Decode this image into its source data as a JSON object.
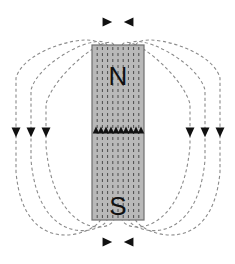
{
  "figure": {
    "canvas": {
      "width": 235,
      "height": 264,
      "background": "#ffffff"
    }
  },
  "magnet": {
    "name": "bar-magnet",
    "x": 92,
    "y": 45,
    "width": 52,
    "height": 175,
    "fill": "#b9b9b9",
    "stroke": "#6e6e6e",
    "stroke_width": 1.2,
    "north_label": "N",
    "south_label": "S",
    "north_label_x": 118,
    "north_label_y": 78,
    "south_label_x": 118,
    "south_label_y": 208,
    "label_font_size": 26,
    "label_color": "#111111"
  },
  "field": {
    "line_color": "#8a8a8a",
    "line_width": 1.1,
    "dash": "3.2 2.6",
    "arrow_color": "#111111",
    "interior_line_count": 9,
    "interior_line_color": "#4a4a4a",
    "exterior_loop_count_per_side": 3,
    "description": "Dashed magnetic field lines looping from N pole over the top, down the sides, and returning to the S pole; interior lines run upward from S to N."
  },
  "chart_data": {
    "type": "diagram",
    "elements": {
      "magnet_poles": [
        "N",
        "S"
      ],
      "interior_field_direction": "upward (S to N)",
      "exterior_field_direction": "N pole out, around, into S pole"
    },
    "interior_arrows": {
      "count": 10,
      "direction": "up",
      "y": 131,
      "x_positions": [
        96,
        101,
        106,
        111,
        116,
        121,
        126,
        131,
        136,
        141
      ]
    },
    "side_arrows_left": {
      "count": 3,
      "direction": "down",
      "y": 131,
      "x_positions": [
        16,
        31,
        46
      ]
    },
    "side_arrows_right": {
      "count": 3,
      "direction": "down",
      "y": 131,
      "x_positions": [
        190,
        205,
        220
      ]
    },
    "top_arrows": {
      "count": 2,
      "directions": [
        "right",
        "left"
      ],
      "positions": [
        [
          106,
          22
        ],
        [
          130,
          22
        ]
      ]
    },
    "bottom_arrows": {
      "count": 2,
      "directions": [
        "right",
        "left"
      ],
      "positions": [
        [
          106,
          242
        ],
        [
          130,
          242
        ]
      ]
    },
    "exterior_loops_left": [
      {
        "apex_y": 18,
        "extent_x": 16
      },
      {
        "apex_y": 30,
        "extent_x": 31
      },
      {
        "apex_y": 44,
        "extent_x": 46
      }
    ],
    "exterior_loops_right": [
      {
        "apex_y": 18,
        "extent_x": 220
      },
      {
        "apex_y": 30,
        "extent_x": 205
      },
      {
        "apex_y": 44,
        "extent_x": 190
      }
    ]
  }
}
